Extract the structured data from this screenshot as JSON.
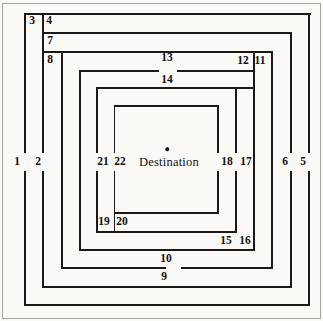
{
  "diagram": {
    "destination_label": "Destination",
    "canvas": {
      "width": 323,
      "height": 321
    },
    "colors": {
      "background": "#faf9f6",
      "line": "#1a1a1a",
      "scan_border": "#a9a59d",
      "text": "#111111"
    },
    "destination": {
      "dot": {
        "x": 167,
        "y": 149
      },
      "text": {
        "x": 169,
        "y": 162
      }
    },
    "segment_labels": [
      {
        "text": "1",
        "x": 17,
        "y": 162
      },
      {
        "text": "2",
        "x": 38,
        "y": 162
      },
      {
        "text": "3",
        "x": 32,
        "y": 21
      },
      {
        "text": "4",
        "x": 49,
        "y": 21
      },
      {
        "text": "5",
        "x": 303,
        "y": 162
      },
      {
        "text": "6",
        "x": 285,
        "y": 162
      },
      {
        "text": "7",
        "x": 50,
        "y": 41
      },
      {
        "text": "8",
        "x": 50,
        "y": 60
      },
      {
        "text": "9",
        "x": 164,
        "y": 277
      },
      {
        "text": "10",
        "x": 166,
        "y": 259
      },
      {
        "text": "11",
        "x": 260,
        "y": 61
      },
      {
        "text": "12",
        "x": 243,
        "y": 61
      },
      {
        "text": "13",
        "x": 167,
        "y": 58
      },
      {
        "text": "14",
        "x": 167,
        "y": 80
      },
      {
        "text": "15",
        "x": 226,
        "y": 241
      },
      {
        "text": "16",
        "x": 245,
        "y": 241
      },
      {
        "text": "17",
        "x": 246,
        "y": 162
      },
      {
        "text": "18",
        "x": 227,
        "y": 162
      },
      {
        "text": "19",
        "x": 104,
        "y": 222
      },
      {
        "text": "20",
        "x": 122,
        "y": 222
      },
      {
        "text": "21",
        "x": 103,
        "y": 162
      },
      {
        "text": "22",
        "x": 120,
        "y": 162
      }
    ],
    "lines": {
      "thickness": 1.5,
      "horizontal": [
        {
          "y": 14,
          "spans": [
            [
              25,
              310
            ]
          ]
        },
        {
          "y": 33,
          "spans": [
            [
              43,
              291.5
            ]
          ]
        },
        {
          "y": 52,
          "spans": [
            [
              43,
              272.5
            ]
          ]
        },
        {
          "y": 71,
          "spans": [
            [
              80,
              158
            ],
            [
              178,
              254.5
            ]
          ]
        },
        {
          "y": 88,
          "spans": [
            [
              97,
              254.5
            ]
          ]
        },
        {
          "y": 106,
          "spans": [
            [
              115,
              218.5
            ]
          ]
        },
        {
          "y": 213,
          "spans": [
            [
              115,
              218.5
            ]
          ]
        },
        {
          "y": 232,
          "spans": [
            [
              97,
              236.5
            ]
          ]
        },
        {
          "y": 250,
          "spans": [
            [
              80,
              254.5
            ]
          ]
        },
        {
          "y": 268,
          "spans": [
            [
              62,
              165
            ],
            [
              182,
              272.5
            ]
          ]
        },
        {
          "y": 287,
          "spans": [
            [
              43,
              291.5
            ]
          ]
        },
        {
          "y": 305,
          "spans": [
            [
              25,
              309.5
            ]
          ]
        }
      ],
      "vertical": [
        {
          "x": 25,
          "spans": [
            [
              14,
              152
            ],
            [
              172,
              305.5
            ]
          ]
        },
        {
          "x": 43,
          "spans": [
            [
              14,
              152
            ],
            [
              172,
              287.5
            ]
          ]
        },
        {
          "x": 62,
          "spans": [
            [
              52,
              268.5
            ]
          ]
        },
        {
          "x": 80,
          "spans": [
            [
              71,
              250.5
            ]
          ]
        },
        {
          "x": 97,
          "spans": [
            [
              88,
              152
            ],
            [
              172,
              232.5
            ]
          ]
        },
        {
          "x": 114.5,
          "spans": [
            [
              106,
              152
            ],
            [
              172,
              232.5
            ]
          ]
        },
        {
          "x": 218,
          "spans": [
            [
              106,
              152
            ],
            [
              172,
              213.5
            ]
          ]
        },
        {
          "x": 236,
          "spans": [
            [
              88,
              152
            ],
            [
              172,
              232.5
            ]
          ]
        },
        {
          "x": 254,
          "spans": [
            [
              52,
              250.5
            ]
          ]
        },
        {
          "x": 272,
          "spans": [
            [
              52,
              268.5
            ]
          ]
        },
        {
          "x": 291,
          "spans": [
            [
              33,
              152
            ],
            [
              172,
              287.5
            ]
          ]
        },
        {
          "x": 309,
          "spans": [
            [
              14,
              152
            ],
            [
              172,
              305.5
            ]
          ]
        }
      ]
    }
  }
}
